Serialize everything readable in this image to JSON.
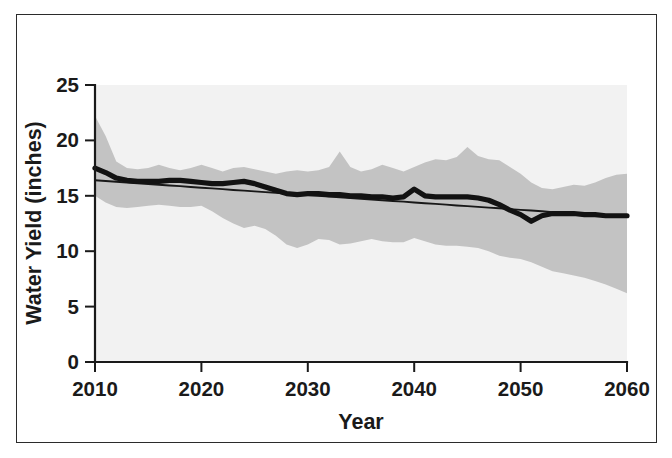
{
  "figure": {
    "border_color": "#2b2b2b",
    "background": "#ffffff"
  },
  "chart_data": {
    "type": "line",
    "title": "",
    "subtitle": "",
    "xlabel": "Year",
    "ylabel": "Water Yield (inches)",
    "xlim": [
      2010,
      2060
    ],
    "ylim": [
      0,
      25
    ],
    "xticks": [
      2010,
      2020,
      2030,
      2040,
      2050,
      2060
    ],
    "xtick_labels": [
      "2010",
      "2020",
      "2030",
      "2040",
      "2050",
      "2060"
    ],
    "yticks": [
      0,
      5,
      10,
      15,
      20,
      25
    ],
    "ytick_labels": [
      "0",
      "5",
      "10",
      "15",
      "20",
      "25"
    ],
    "grid": false,
    "legend": null,
    "plot_background": "#f2f2f2",
    "band_color": "#c3c3c3",
    "line_color": "#121212",
    "trend_color": "#181818",
    "annotations": [],
    "x": [
      2010,
      2011,
      2012,
      2013,
      2014,
      2015,
      2016,
      2017,
      2018,
      2019,
      2020,
      2021,
      2022,
      2023,
      2024,
      2025,
      2026,
      2027,
      2028,
      2029,
      2030,
      2031,
      2032,
      2033,
      2034,
      2035,
      2036,
      2037,
      2038,
      2039,
      2040,
      2041,
      2042,
      2043,
      2044,
      2045,
      2046,
      2047,
      2048,
      2049,
      2050,
      2051,
      2052,
      2053,
      2054,
      2055,
      2056,
      2057,
      2058,
      2059,
      2060
    ],
    "series": [
      {
        "name": "Median water yield",
        "style": "thick-line",
        "values": [
          17.5,
          17.1,
          16.6,
          16.4,
          16.3,
          16.3,
          16.3,
          16.4,
          16.4,
          16.3,
          16.2,
          16.1,
          16.1,
          16.2,
          16.3,
          16.1,
          15.8,
          15.5,
          15.2,
          15.1,
          15.2,
          15.2,
          15.1,
          15.1,
          15.0,
          15.0,
          14.9,
          14.9,
          14.8,
          14.9,
          15.6,
          15.0,
          14.9,
          14.9,
          14.9,
          14.9,
          14.8,
          14.6,
          14.2,
          13.7,
          13.3,
          12.7,
          13.2,
          13.4,
          13.4,
          13.4,
          13.3,
          13.3,
          13.2,
          13.2,
          13.2
        ]
      },
      {
        "name": "Linear trend",
        "style": "thin-line",
        "values": [
          16.4,
          16.33,
          16.27,
          16.2,
          16.13,
          16.07,
          16.0,
          15.93,
          15.87,
          15.8,
          15.73,
          15.67,
          15.6,
          15.53,
          15.47,
          15.4,
          15.33,
          15.27,
          15.2,
          15.13,
          15.07,
          15.0,
          14.93,
          14.87,
          14.8,
          14.73,
          14.67,
          14.6,
          14.53,
          14.47,
          14.4,
          14.33,
          14.27,
          14.2,
          14.13,
          14.07,
          14.0,
          13.93,
          13.87,
          13.8,
          13.73,
          13.67,
          13.6,
          13.53,
          13.47,
          13.4,
          13.33,
          13.27,
          13.2,
          13.13,
          13.1
        ]
      }
    ],
    "band": {
      "name": "Projection range",
      "upper": [
        22.2,
        20.4,
        18.1,
        17.5,
        17.4,
        17.5,
        17.8,
        17.5,
        17.3,
        17.5,
        17.8,
        17.5,
        17.2,
        17.5,
        17.6,
        17.4,
        17.2,
        17.0,
        17.2,
        17.3,
        17.2,
        17.3,
        17.6,
        19.0,
        17.6,
        17.2,
        17.4,
        17.8,
        17.5,
        17.2,
        17.6,
        18.0,
        18.3,
        18.2,
        18.5,
        19.4,
        18.6,
        18.3,
        18.2,
        17.6,
        17.0,
        16.2,
        15.7,
        15.6,
        15.8,
        16.0,
        15.9,
        16.2,
        16.6,
        16.9,
        17.0
      ],
      "lower": [
        15.0,
        14.4,
        14.0,
        13.9,
        14.0,
        14.1,
        14.2,
        14.1,
        14.0,
        14.0,
        14.1,
        13.6,
        13.0,
        12.5,
        12.1,
        12.3,
        12.0,
        11.4,
        10.6,
        10.3,
        10.6,
        11.1,
        11.0,
        10.6,
        10.7,
        10.9,
        11.1,
        10.9,
        10.8,
        10.8,
        11.2,
        10.9,
        10.6,
        10.5,
        10.5,
        10.4,
        10.3,
        10.0,
        9.6,
        9.4,
        9.3,
        9.0,
        8.6,
        8.2,
        8.0,
        7.8,
        7.6,
        7.3,
        7.0,
        6.6,
        6.2
      ]
    }
  }
}
